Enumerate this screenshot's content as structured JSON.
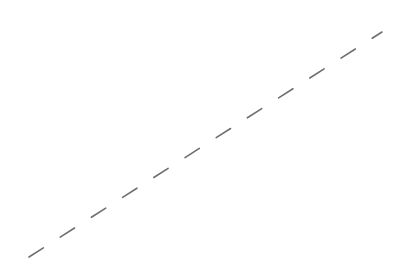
{
  "canvas": {
    "width": 406,
    "height": 273,
    "background": "#ffffff"
  },
  "line": {
    "type": "dashed",
    "x1": 29,
    "y1": 257,
    "x2": 382,
    "y2": 32,
    "color": "#6e6e6e",
    "stroke_width": 1.6,
    "dash": "17 20"
  }
}
